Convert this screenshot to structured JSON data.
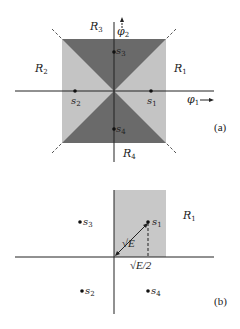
{
  "colors": {
    "light_region": "#c4c4c4",
    "dark_region": "#6a6a6a",
    "axis": "#222222",
    "shaded_b": "#c8c8c8"
  },
  "panel_a": {
    "caption": "(a)",
    "axis_x_label": "φ",
    "axis_x_sub": "1",
    "axis_y_label": "φ",
    "axis_y_sub": "2",
    "regions": [
      {
        "name": "R",
        "sub": "1"
      },
      {
        "name": "R",
        "sub": "2"
      },
      {
        "name": "R",
        "sub": "3"
      },
      {
        "name": "R",
        "sub": "4"
      }
    ],
    "points": [
      {
        "name": "s",
        "sub": "1"
      },
      {
        "name": "s",
        "sub": "2"
      },
      {
        "name": "s",
        "sub": "3"
      },
      {
        "name": "s",
        "sub": "4"
      }
    ]
  },
  "panel_b": {
    "caption": "(b)",
    "region": {
      "name": "R",
      "sub": "1"
    },
    "distance_label": "√E",
    "projection_label": "√E/2",
    "points": [
      {
        "name": "s",
        "sub": "1"
      },
      {
        "name": "s",
        "sub": "2"
      },
      {
        "name": "s",
        "sub": "3"
      },
      {
        "name": "s",
        "sub": "4"
      }
    ]
  }
}
